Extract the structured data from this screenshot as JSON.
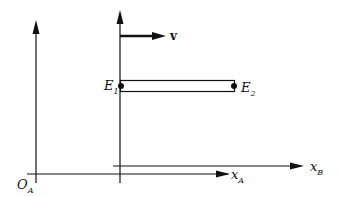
{
  "diagram": {
    "type": "reference-frames",
    "labels": {
      "origin_A": {
        "main": "O",
        "sub": "A"
      },
      "axis_A": {
        "main": "x",
        "sub": "A"
      },
      "axis_B": {
        "main": "x",
        "sub": "B"
      },
      "event_1": {
        "main": "E",
        "sub": "1"
      },
      "event_2": {
        "main": "E",
        "sub": "2"
      },
      "velocity": "v"
    },
    "colors": {
      "stroke": "#111111",
      "background": "#ffffff"
    }
  }
}
